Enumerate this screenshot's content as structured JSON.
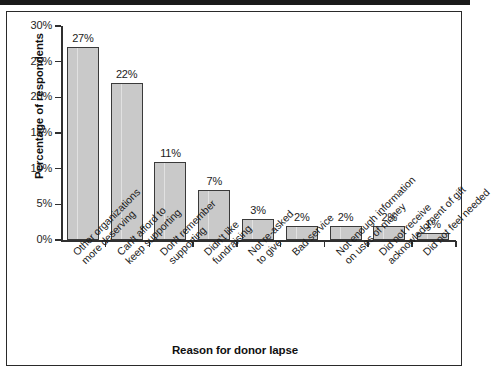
{
  "chart_data": {
    "type": "bar",
    "title": "",
    "xlabel": "Reason for donor lapse",
    "ylabel": "Percentage of respondents",
    "ylim": [
      0,
      30
    ],
    "ytick_labels": [
      "0%",
      "5%",
      "10%",
      "15%",
      "20%",
      "25%",
      "30%"
    ],
    "ytick_values": [
      0,
      5,
      10,
      15,
      20,
      25,
      30
    ],
    "grid": false,
    "legend": "none",
    "bar_color": "#c9c9c9",
    "bar_edge_color": "#3a3a3a",
    "categories": [
      "Other organizations more deserving",
      "Can't afford to keep supporting",
      "Don't remember supporting",
      "Didn't like fundraising",
      "Not re-asked to give",
      "Bad service",
      "Not enough information on uses of money",
      "Did not receive acknowledgment of gift",
      "Did not feel needed"
    ],
    "category_lines": [
      [
        "Other organizations",
        "more deserving"
      ],
      [
        "Can't afford to",
        "keep supporting"
      ],
      [
        "Don't remember",
        "supporting"
      ],
      [
        "Didn't like",
        "fundraising"
      ],
      [
        "Not re-asked",
        "to give"
      ],
      [
        "Bad service"
      ],
      [
        "Not enough information",
        "on uses of money"
      ],
      [
        "Did not receive",
        "acknowledgment of gift"
      ],
      [
        "Did not feel needed"
      ]
    ],
    "values": [
      27,
      22,
      11,
      7,
      3,
      2,
      2,
      2,
      1
    ],
    "value_labels": [
      "27%",
      "22%",
      "11%",
      "7%",
      "3%",
      "2%",
      "2%",
      "2%",
      "1%"
    ]
  }
}
